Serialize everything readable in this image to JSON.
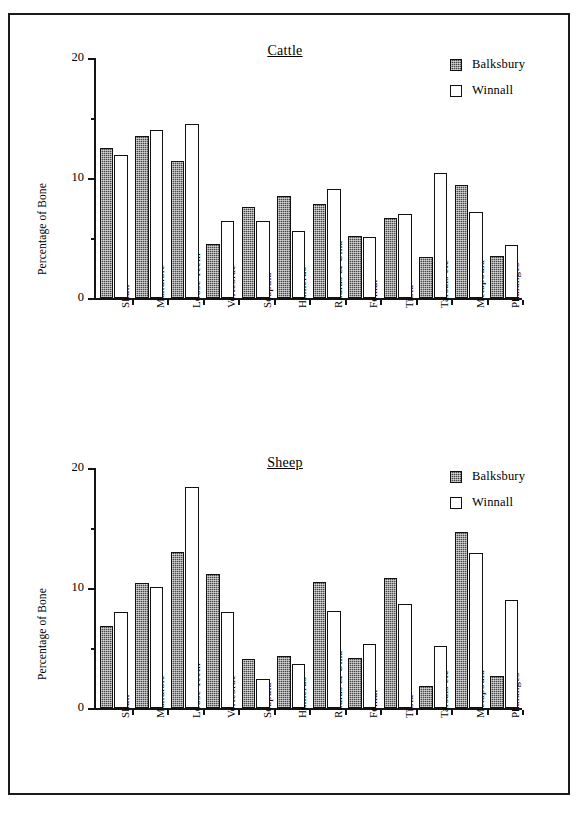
{
  "figure": {
    "y_axis_label": "Percentage of Bone",
    "y_ticks_major": [
      "0",
      "10",
      "20"
    ],
    "legend": [
      {
        "key": "balksbury",
        "label": "Balksbury",
        "swatch": "dark-hatched",
        "color": "#4a4a4a"
      },
      {
        "key": "winnall",
        "label": "Winnall",
        "swatch": "white-outline",
        "color": "#ffffff"
      }
    ]
  },
  "chart_data": [
    {
      "id": "cattle",
      "type": "bar",
      "title": "Cattle",
      "xlabel": "",
      "ylabel": "Percentage of Bone",
      "ylim": [
        0,
        20
      ],
      "yticks": [
        0,
        10,
        20
      ],
      "yticks_minor": [
        5,
        15
      ],
      "grid": false,
      "legend_position": "top-right",
      "categories": [
        "Skull",
        "Mandible",
        "Loose Teeth",
        "Vertebrae",
        "Scapula",
        "Humerus",
        "Radius & Ulna",
        "Femur",
        "Tibia",
        "Tarsals etc",
        "Metapodia",
        "Phalanges"
      ],
      "series": [
        {
          "name": "Balksbury",
          "values": [
            12.5,
            13.5,
            11.4,
            4.5,
            7.6,
            8.5,
            7.8,
            5.2,
            6.7,
            3.4,
            9.4,
            3.5
          ]
        },
        {
          "name": "Winnall",
          "values": [
            11.9,
            14.0,
            14.5,
            6.4,
            6.4,
            5.6,
            9.1,
            5.1,
            7.0,
            10.4,
            7.2,
            4.4
          ]
        }
      ]
    },
    {
      "id": "sheep",
      "type": "bar",
      "title": "Sheep",
      "xlabel": "",
      "ylabel": "Percentage of Bone",
      "ylim": [
        0,
        20
      ],
      "yticks": [
        0,
        10,
        20
      ],
      "yticks_minor": [
        5,
        15
      ],
      "grid": false,
      "legend_position": "top-right",
      "categories": [
        "Skull",
        "Mandible",
        "Loose Teeth",
        "Vertebrae",
        "Scapula",
        "Humerus",
        "Radius & Ulna",
        "Femur",
        "Tibia",
        "Tarsals etc",
        "Metapodia",
        "Phalanges"
      ],
      "series": [
        {
          "name": "Balksbury",
          "values": [
            6.8,
            10.4,
            13.0,
            11.2,
            4.1,
            4.3,
            10.5,
            4.2,
            10.8,
            1.8,
            14.7,
            2.7
          ]
        },
        {
          "name": "Winnall",
          "values": [
            8.0,
            10.1,
            18.4,
            8.0,
            2.4,
            3.7,
            8.1,
            5.3,
            8.7,
            5.2,
            12.9,
            9.0
          ]
        }
      ]
    }
  ]
}
